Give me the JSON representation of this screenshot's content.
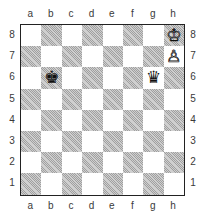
{
  "board": {
    "files": [
      "a",
      "b",
      "c",
      "d",
      "e",
      "f",
      "g",
      "h"
    ],
    "ranks": [
      "8",
      "7",
      "6",
      "5",
      "4",
      "3",
      "2",
      "1"
    ],
    "colors": {
      "light": "#ffffff",
      "dark": "#cfcfcf",
      "border": "#222222"
    },
    "pieces": [
      {
        "square": "h8",
        "color": "white",
        "type": "king",
        "glyph": "♔"
      },
      {
        "square": "h7",
        "color": "white",
        "type": "pawn",
        "glyph": "♙"
      },
      {
        "square": "b6",
        "color": "black",
        "type": "king",
        "glyph": "♚"
      },
      {
        "square": "g6",
        "color": "black",
        "type": "queen",
        "glyph": "♛"
      }
    ]
  }
}
